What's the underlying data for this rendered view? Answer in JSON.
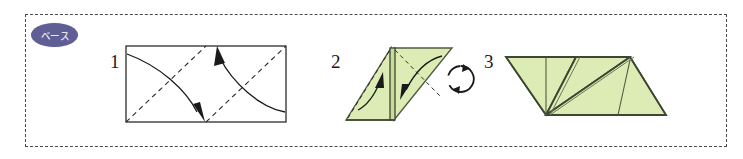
{
  "page": {
    "background_color": "#ffffff"
  },
  "frame": {
    "name": "dashed-panel",
    "border_style": "dashed",
    "border_color": "#4a4a4a"
  },
  "badge": {
    "label": "ベース",
    "meaning": "base",
    "fill_color": "#5f5f96",
    "text_color": "#ffffff"
  },
  "colors": {
    "paper_front": "#dcecb4",
    "paper_shade": "#c8dc9a",
    "paper_edge": "#4f5a40",
    "line": "#1a1a1a",
    "crease_dashed": "#2b2b2b"
  },
  "steps": [
    {
      "number": "1",
      "shape": "rectangle",
      "fill": "white",
      "creases": "two dashed diagonals",
      "arrows": "two curved fold arrows"
    },
    {
      "number": "2",
      "shape": "parallelogram",
      "fill": "green",
      "creases": "dashed diagonals with vertical center spine",
      "arrows": "two curved fold arrows"
    },
    {
      "number": "3",
      "shape": "parallelogram",
      "fill": "green",
      "creases": "vertical fold lines and V-shaped valley fold",
      "arrows": "none"
    }
  ],
  "rotate_icon": {
    "name": "rotate-icon",
    "label": "rotate",
    "direction": "clockwise"
  }
}
